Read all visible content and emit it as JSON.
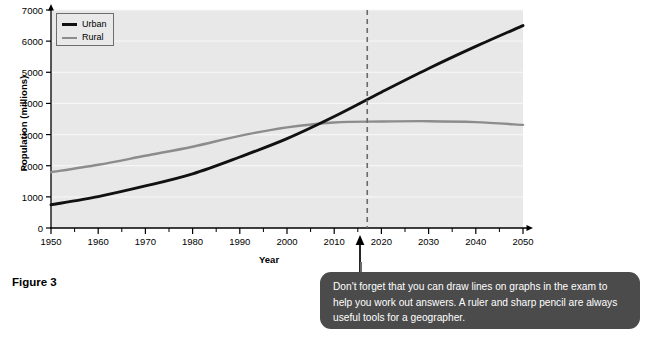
{
  "figure": {
    "caption": "Figure 3"
  },
  "callout": {
    "text": "Don't forget that you can draw lines on graphs in the exam to help you work out answers. A ruler and sharp pencil are always useful tools for a geographer."
  },
  "colors": {
    "urban_line": "#111111",
    "rural_line": "#8c8c8c",
    "plot_background": "#e8e8e8",
    "gridline": "#f4f4f4",
    "axis": "#000000",
    "marker_line": "#666666",
    "callout_background": "#4b4b4b",
    "callout_text": "#ffffff"
  },
  "chart_data": {
    "type": "line",
    "title": "",
    "xlabel": "Year",
    "ylabel": "Population (millions)",
    "xlim": [
      1950,
      2050
    ],
    "ylim": [
      0,
      7000
    ],
    "xticks": [
      1950,
      1960,
      1970,
      1980,
      1990,
      2000,
      2010,
      2020,
      2030,
      2040,
      2050
    ],
    "xtick_labels": [
      "1950",
      "1960",
      "1970",
      "1980",
      "1990",
      "2000",
      "2010",
      "2020",
      "2030",
      "2040",
      "2050"
    ],
    "x_minor_ticks": [
      1955,
      1965,
      1975,
      1985,
      1995,
      2005,
      2015,
      2025,
      2035,
      2045
    ],
    "yticks": [
      0,
      1000,
      2000,
      3000,
      4000,
      5000,
      6000,
      7000
    ],
    "ytick_labels": [
      "0",
      "1000",
      "2000",
      "3000",
      "4000",
      "5000",
      "6000",
      "7000"
    ],
    "grid": true,
    "legend_position": "upper left",
    "x": [
      1950,
      1960,
      1970,
      1980,
      1990,
      2000,
      2010,
      2020,
      2030,
      2040,
      2050
    ],
    "series": [
      {
        "name": "Urban",
        "color": "#111111",
        "values": [
          745,
          1010,
          1350,
          1740,
          2280,
          2870,
          3580,
          4360,
          5120,
          5830,
          6500
        ]
      },
      {
        "name": "Rural",
        "color": "#8c8c8c",
        "values": [
          1790,
          2030,
          2320,
          2610,
          2960,
          3230,
          3390,
          3420,
          3430,
          3400,
          3310
        ]
      }
    ],
    "annotations": [
      {
        "type": "vertical-dashed-line",
        "x": 2017,
        "label": ""
      }
    ],
    "crossover": {
      "x": 2007,
      "y": 3350
    }
  }
}
